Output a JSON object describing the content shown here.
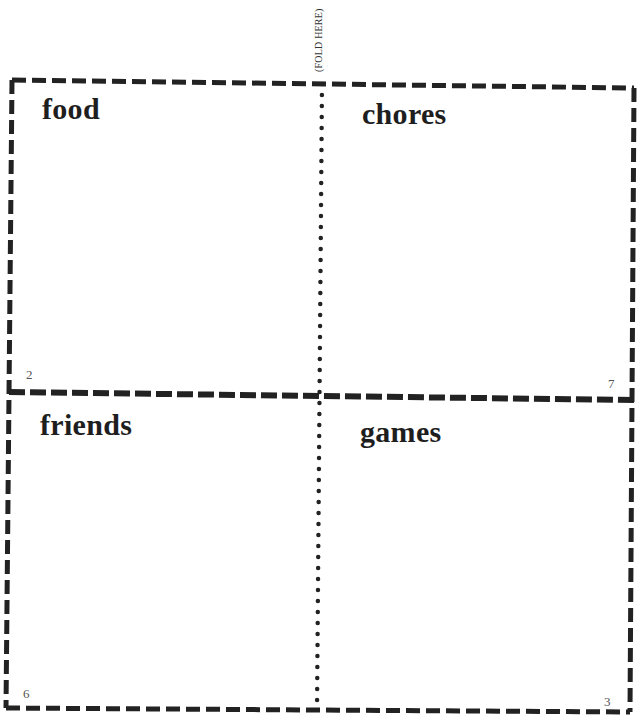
{
  "fold_label": "(FOLD HERE)",
  "panels": [
    {
      "title": "food",
      "page_number": "2"
    },
    {
      "title": "chores",
      "page_number": "7"
    },
    {
      "title": "friends",
      "page_number": "6"
    },
    {
      "title": "games",
      "page_number": "3"
    }
  ],
  "colors": {
    "line": "#222222",
    "background": "#ffffff"
  }
}
